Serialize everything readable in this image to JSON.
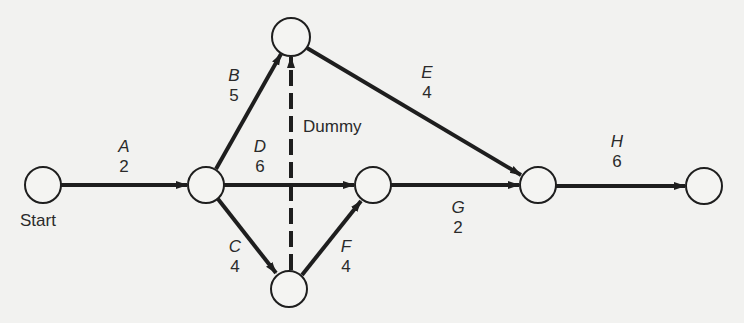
{
  "diagram": {
    "type": "activity-on-arrow network",
    "colors": {
      "background": "#f2f2f0",
      "stroke": "#1e1e1e",
      "text": "#2a2a2a"
    },
    "nodes": [
      {
        "id": "n1",
        "label": "Start",
        "x": 43,
        "y": 185
      },
      {
        "id": "n2",
        "label": "",
        "x": 206,
        "y": 185
      },
      {
        "id": "n3",
        "label": "",
        "x": 291,
        "y": 37
      },
      {
        "id": "n4",
        "label": "",
        "x": 289,
        "y": 289
      },
      {
        "id": "n5",
        "label": "",
        "x": 373,
        "y": 185
      },
      {
        "id": "n6",
        "label": "",
        "x": 538,
        "y": 185
      },
      {
        "id": "n7",
        "label": "",
        "x": 704,
        "y": 186
      }
    ],
    "activities": [
      {
        "name": "A",
        "duration": "2",
        "from": "n1",
        "to": "n2"
      },
      {
        "name": "B",
        "duration": "5",
        "from": "n2",
        "to": "n3"
      },
      {
        "name": "C",
        "duration": "4",
        "from": "n2",
        "to": "n4"
      },
      {
        "name": "D",
        "duration": "6",
        "from": "n2",
        "to": "n5"
      },
      {
        "name": "E",
        "duration": "4",
        "from": "n3",
        "to": "n6"
      },
      {
        "name": "F",
        "duration": "4",
        "from": "n4",
        "to": "n5"
      },
      {
        "name": "G",
        "duration": "2",
        "from": "n5",
        "to": "n6"
      },
      {
        "name": "H",
        "duration": "6",
        "from": "n6",
        "to": "n7"
      }
    ],
    "dummy": {
      "label": "Dummy",
      "from": "n4",
      "to": "n3",
      "style": "dashed"
    },
    "start_label": "Start"
  }
}
